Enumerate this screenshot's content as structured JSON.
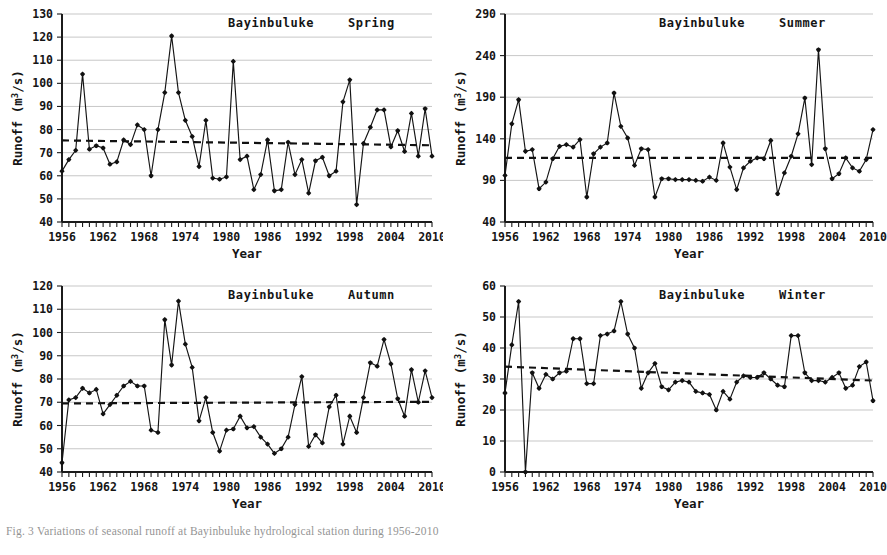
{
  "figure": {
    "caption": "Fig. 3  Variations of seasonal runoff at Bayinbuluke hydrological station during 1956-2010"
  },
  "panels": [
    {
      "key": "spring",
      "station": "Bayinbuluke",
      "season": "Spring",
      "ylabel": "Runoff (m",
      "ylabel_sup": "3",
      "ylabel_tail": "/s)",
      "xlabel": "Year"
    },
    {
      "key": "summer",
      "station": "Bayinbuluke",
      "season": "Summer",
      "ylabel": "Runoff (m",
      "ylabel_sup": "3",
      "ylabel_tail": "/s)",
      "xlabel": "Year"
    },
    {
      "key": "autumn",
      "station": "Bayinbuluke",
      "season": "Autumn",
      "ylabel": "Runoff (m",
      "ylabel_sup": "3",
      "ylabel_tail": "/s)",
      "xlabel": "Year"
    },
    {
      "key": "winter",
      "station": "Bayinbuluke",
      "season": "Winter",
      "ylabel": "Runoff (m",
      "ylabel_sup": "3",
      "ylabel_tail": "/s)",
      "xlabel": "Year"
    }
  ],
  "chart_data": [
    {
      "type": "line",
      "id": "spring",
      "title": "Bayinbuluke   Spring",
      "xlabel": "Year",
      "ylabel": "Runoff (m3/s)",
      "xlim": [
        1956,
        2010
      ],
      "ylim": [
        40,
        130
      ],
      "yticks": [
        40,
        50,
        60,
        70,
        80,
        90,
        100,
        110,
        120,
        130
      ],
      "xticks": [
        1956,
        1962,
        1968,
        1974,
        1980,
        1986,
        1992,
        1998,
        2004,
        2010
      ],
      "grid": true,
      "legend": false,
      "x": [
        1956,
        1957,
        1958,
        1959,
        1960,
        1961,
        1962,
        1963,
        1964,
        1965,
        1966,
        1967,
        1968,
        1969,
        1970,
        1971,
        1972,
        1973,
        1974,
        1975,
        1976,
        1977,
        1978,
        1979,
        1980,
        1981,
        1982,
        1983,
        1984,
        1985,
        1986,
        1987,
        1988,
        1989,
        1990,
        1991,
        1992,
        1993,
        1994,
        1995,
        1996,
        1997,
        1998,
        1999,
        2000,
        2001,
        2002,
        2003,
        2004,
        2005,
        2006,
        2007,
        2008,
        2009,
        2010
      ],
      "series": [
        {
          "name": "Spring runoff",
          "values": [
            62,
            67,
            71,
            104,
            71.5,
            73,
            72,
            65,
            66,
            75.5,
            73.5,
            82,
            80,
            60,
            80,
            96,
            120.5,
            96,
            84,
            77,
            64,
            84,
            59,
            58.5,
            59.5,
            109.5,
            67,
            68.5,
            54,
            60.5,
            75.5,
            53.5,
            54,
            74.5,
            60.5,
            67,
            52.5,
            66.5,
            68,
            60,
            62,
            92,
            101.5,
            47.5,
            74,
            81,
            88.5,
            88.5,
            72.5,
            79.5,
            70.5,
            87,
            68.5,
            89,
            68.5
          ]
        }
      ],
      "trend": {
        "name": "Linear trend",
        "start": 75.3,
        "end": 73.2,
        "style": "dashed"
      }
    },
    {
      "type": "line",
      "id": "summer",
      "title": "Bayinbuluke   Summer",
      "xlabel": "Year",
      "ylabel": "Runoff (m3/s)",
      "xlim": [
        1956,
        2010
      ],
      "ylim": [
        40,
        290
      ],
      "yticks": [
        40,
        90,
        140,
        190,
        240,
        290
      ],
      "xticks": [
        1956,
        1962,
        1968,
        1974,
        1980,
        1986,
        1992,
        1998,
        2004,
        2010
      ],
      "grid": true,
      "legend": false,
      "x": [
        1956,
        1957,
        1958,
        1959,
        1960,
        1961,
        1962,
        1963,
        1964,
        1965,
        1966,
        1967,
        1968,
        1969,
        1970,
        1971,
        1972,
        1973,
        1974,
        1975,
        1976,
        1977,
        1978,
        1979,
        1980,
        1981,
        1982,
        1983,
        1984,
        1985,
        1986,
        1987,
        1988,
        1989,
        1990,
        1991,
        1992,
        1993,
        1994,
        1995,
        1996,
        1997,
        1998,
        1999,
        2000,
        2001,
        2002,
        2003,
        2004,
        2005,
        2006,
        2007,
        2008,
        2009,
        2010
      ],
      "series": [
        {
          "name": "Summer runoff",
          "values": [
            96,
            158,
            187,
            125,
            127,
            80,
            88,
            116,
            131,
            133,
            130,
            139,
            70,
            122,
            130,
            135,
            195,
            155,
            141,
            108,
            128,
            127,
            70,
            92,
            92,
            91,
            91,
            91,
            90,
            89,
            94,
            90,
            135,
            106,
            79,
            105,
            113,
            117,
            116,
            138,
            74,
            99,
            119,
            146,
            189,
            109,
            247,
            128,
            92,
            98,
            117,
            105,
            101,
            115,
            151
          ]
        }
      ],
      "trend": {
        "name": "Linear trend",
        "start": 117,
        "end": 117,
        "style": "dashed"
      }
    },
    {
      "type": "line",
      "id": "autumn",
      "title": "Bayinbuluke   Autumn",
      "xlabel": "Year",
      "ylabel": "Runoff (m3/s)",
      "xlim": [
        1956,
        2010
      ],
      "ylim": [
        40,
        120
      ],
      "yticks": [
        40,
        50,
        60,
        70,
        80,
        90,
        100,
        110,
        120
      ],
      "xticks": [
        1956,
        1962,
        1968,
        1974,
        1980,
        1986,
        1992,
        1998,
        2004,
        2010
      ],
      "grid": true,
      "legend": false,
      "x": [
        1956,
        1957,
        1958,
        1959,
        1960,
        1961,
        1962,
        1963,
        1964,
        1965,
        1966,
        1967,
        1968,
        1969,
        1970,
        1971,
        1972,
        1973,
        1974,
        1975,
        1976,
        1977,
        1978,
        1979,
        1980,
        1981,
        1982,
        1983,
        1984,
        1985,
        1986,
        1987,
        1988,
        1989,
        1990,
        1991,
        1992,
        1993,
        1994,
        1995,
        1996,
        1997,
        1998,
        1999,
        2000,
        2001,
        2002,
        2003,
        2004,
        2005,
        2006,
        2007,
        2008,
        2009,
        2010
      ],
      "series": [
        {
          "name": "Autumn runoff",
          "values": [
            44,
            71,
            72,
            76,
            74,
            75.5,
            65,
            69,
            73,
            77,
            79,
            77,
            77,
            58,
            57,
            105.5,
            86,
            113.5,
            95,
            85,
            62,
            72,
            57,
            49,
            58,
            58.5,
            64,
            59,
            59.5,
            55,
            52,
            48,
            50,
            55,
            69,
            81,
            51,
            56,
            52.5,
            68,
            73,
            52,
            64,
            57,
            72,
            87,
            85.5,
            97,
            86.5,
            71.5,
            64,
            84,
            70,
            83.5,
            72
          ]
        }
      ],
      "trend": {
        "name": "Linear trend",
        "start": 69.5,
        "end": 70.2,
        "style": "dashed"
      }
    },
    {
      "type": "line",
      "id": "winter",
      "title": "Bayinbuluke   Winter",
      "xlabel": "Year",
      "ylabel": "Runoff (m3/s)",
      "xlim": [
        1956,
        2010
      ],
      "ylim": [
        0,
        60
      ],
      "yticks": [
        0,
        10,
        20,
        30,
        40,
        50,
        60
      ],
      "xticks": [
        1956,
        1962,
        1968,
        1974,
        1980,
        1986,
        1992,
        1998,
        2004,
        2010
      ],
      "grid": true,
      "legend": false,
      "x": [
        1956,
        1957,
        1958,
        1959,
        1960,
        1961,
        1962,
        1963,
        1964,
        1965,
        1966,
        1967,
        1968,
        1969,
        1970,
        1971,
        1972,
        1973,
        1974,
        1975,
        1976,
        1977,
        1978,
        1979,
        1980,
        1981,
        1982,
        1983,
        1984,
        1985,
        1986,
        1987,
        1988,
        1989,
        1990,
        1991,
        1992,
        1993,
        1994,
        1995,
        1996,
        1997,
        1998,
        1999,
        2000,
        2001,
        2002,
        2003,
        2004,
        2005,
        2006,
        2007,
        2008,
        2009,
        2010
      ],
      "series": [
        {
          "name": "Winter runoff",
          "values": [
            25.5,
            41,
            55,
            0,
            32,
            27,
            31.5,
            30,
            32,
            32.5,
            43,
            43,
            28.5,
            28.5,
            44,
            44.5,
            45.5,
            55,
            44.5,
            40,
            27,
            32,
            35,
            27.5,
            26.5,
            29,
            29.5,
            29,
            26,
            25.5,
            25,
            20,
            26,
            23.5,
            29,
            31,
            30.5,
            30.5,
            32,
            30,
            28,
            27.5,
            44,
            44,
            32,
            29.5,
            29.5,
            29,
            30.5,
            32,
            27,
            28,
            34,
            35.5,
            23
          ]
        }
      ],
      "trend": {
        "name": "Linear trend",
        "start": 34,
        "end": 29.5,
        "style": "dashed"
      }
    }
  ]
}
